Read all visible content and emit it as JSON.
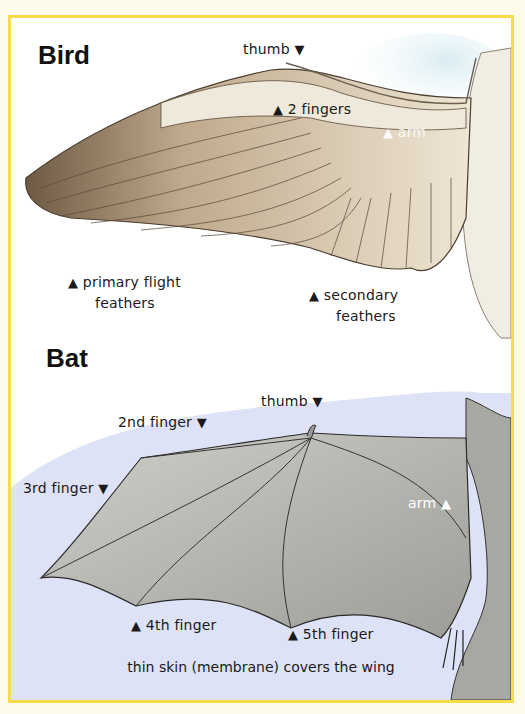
{
  "bird": {
    "title": "Bird",
    "labels": {
      "thumb": "thumb",
      "fingers": "2 fingers",
      "arm": "arm",
      "primary_line1": "primary flight",
      "primary_line2": "feathers",
      "secondary_line1": "secondary",
      "secondary_line2": "feathers"
    }
  },
  "bat": {
    "title": "Bat",
    "labels": {
      "thumb": "thumb",
      "finger2": "2nd finger",
      "finger3": "3rd finger",
      "arm": "arm",
      "finger4": "4th finger",
      "finger5": "5th finger"
    },
    "caption": "thin skin (membrane) covers the wing"
  },
  "icons": {
    "down": "▼",
    "up": "▲"
  },
  "colors": {
    "border": "#f6dc4a",
    "background": "#fffbea",
    "membrane": "#b9b9b4",
    "sky": "#aeb9e6",
    "feather": "#a89478"
  }
}
